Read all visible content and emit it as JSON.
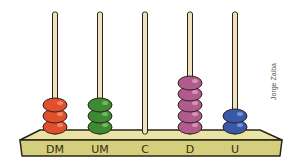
{
  "credit": "Jorge Zaiba",
  "colors": {
    "base_top": "#e9e4a6",
    "base_front": "#d3cf7c",
    "outline": "#2b2416",
    "rod": "#efe2c0"
  },
  "rods": [
    {
      "label": "DM",
      "beads": 3,
      "color": "#e0502e",
      "highlight": "#f58c6a"
    },
    {
      "label": "UM",
      "beads": 3,
      "color": "#3e8a32",
      "highlight": "#7cc06a"
    },
    {
      "label": "C",
      "beads": 0,
      "color": "#999999",
      "highlight": "#cccccc"
    },
    {
      "label": "D",
      "beads": 5,
      "color": "#b05a8e",
      "highlight": "#dc9cc0"
    },
    {
      "label": "U",
      "beads": 2,
      "color": "#3a58a8",
      "highlight": "#7f9be0"
    }
  ]
}
